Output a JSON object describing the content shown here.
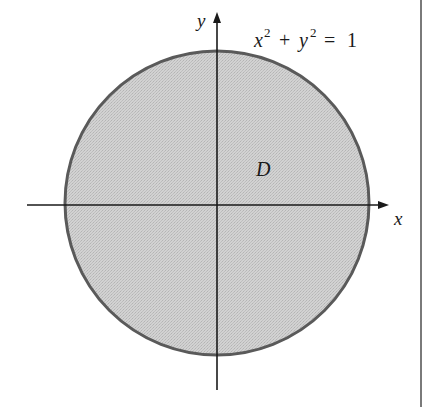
{
  "diagram": {
    "type": "region-in-plane",
    "axes": {
      "x_label": "x",
      "y_label": "y"
    },
    "curve": {
      "equation_lhs_x": "x",
      "equation_lhs_x_exp": "2",
      "equation_plus": "+",
      "equation_lhs_y": "y",
      "equation_lhs_y_exp": "2",
      "equation_eq": "=",
      "equation_rhs": "1",
      "shape": "circle",
      "radius": 1
    },
    "region": {
      "label": "D",
      "fill_color": "#c8c8c8",
      "boundary_color": "#5a5a5a"
    },
    "colors": {
      "axis": "#1a1a1a",
      "frame_border": "#7a7a7a",
      "background": "#ffffff"
    }
  }
}
